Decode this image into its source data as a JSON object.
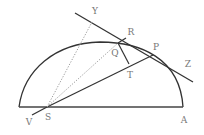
{
  "diagram": {
    "type": "geometry",
    "colors": {
      "stroke": "#333333",
      "dotted": "#999999",
      "label": "#777777",
      "background": "#ffffff"
    },
    "points": {
      "Y": {
        "label": "Y",
        "x": 92,
        "y": 22,
        "label_x": 95,
        "label_y": 11
      },
      "R": {
        "label": "R",
        "x": 126,
        "y": 38,
        "label_x": 131,
        "label_y": 32
      },
      "Q": {
        "label": "Q",
        "x": 118,
        "y": 43,
        "label_x": 115,
        "label_y": 53
      },
      "P": {
        "label": "P",
        "x": 153,
        "y": 55,
        "label_x": 156,
        "label_y": 47
      },
      "T": {
        "label": "T",
        "x": 129,
        "y": 64,
        "label_x": 130,
        "label_y": 75
      },
      "Z": {
        "label": "Z",
        "x": 193,
        "y": 82,
        "label_x": 188,
        "label_y": 64
      },
      "S": {
        "label": "S",
        "x": 47,
        "y": 107,
        "label_x": 48,
        "label_y": 117
      },
      "V": {
        "label": "V",
        "x": 32,
        "y": 115,
        "label_x": 29,
        "label_y": 122
      },
      "A": {
        "label": "A",
        "x": 183,
        "y": 107,
        "label_x": 184,
        "label_y": 120
      }
    },
    "segments": [
      {
        "name": "diameter",
        "from": "left-end",
        "to": "A",
        "style": "solid"
      },
      {
        "name": "tangent-line",
        "from": "top-left",
        "to": "Z",
        "style": "solid"
      },
      {
        "name": "S-P",
        "from": "S",
        "to": "P",
        "style": "solid"
      },
      {
        "name": "V-S",
        "from": "V",
        "to": "S",
        "style": "solid"
      },
      {
        "name": "Q-R",
        "from": "Q",
        "to": "R",
        "style": "solid"
      },
      {
        "name": "Q-T",
        "from": "Q",
        "to": "T",
        "style": "solid"
      },
      {
        "name": "S-Y",
        "from": "S",
        "to": "Y",
        "style": "dotted"
      },
      {
        "name": "S-Q",
        "from": "S",
        "to": "Q",
        "style": "dotted"
      }
    ],
    "curves": [
      {
        "name": "semi-ellipse-arc",
        "from": "left-end",
        "to": "A",
        "style": "solid"
      }
    ]
  }
}
